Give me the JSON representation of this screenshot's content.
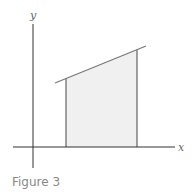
{
  "figure": {
    "caption": "Figure 3",
    "x_axis_label": "x",
    "y_axis_label": "y",
    "colors": {
      "axis": "#333333",
      "line": "#777777",
      "fill": "#f0f0f0",
      "caption": "#888888"
    }
  }
}
